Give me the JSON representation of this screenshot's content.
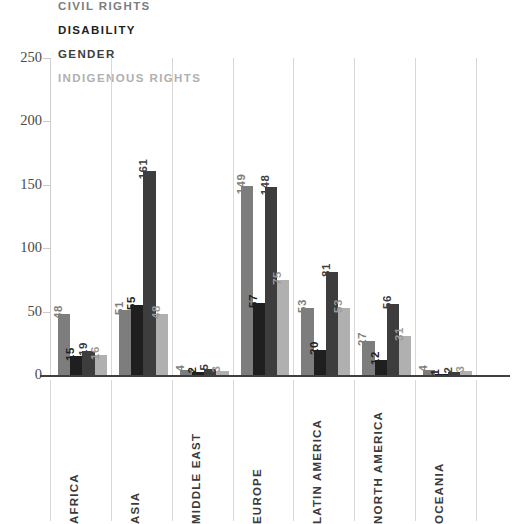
{
  "chart_data": {
    "type": "bar",
    "title": "",
    "xlabel": "",
    "ylabel": "",
    "ylim": [
      0,
      250
    ],
    "yticks": [
      0,
      50,
      100,
      150,
      200,
      250
    ],
    "grid": false,
    "legend_position": "top-left",
    "categories": [
      "AFRICA",
      "ASIA",
      "MIDDLE EAST",
      "EUROPE",
      "LATIN AMERICA",
      "NORTH AMERICA",
      "OCEANIA"
    ],
    "series": [
      {
        "name": "CIVIL RIGHTS",
        "color": "#7d7d7d",
        "values": [
          48,
          51,
          4,
          149,
          53,
          27,
          4
        ]
      },
      {
        "name": "DISABILITY",
        "color": "#1f1f1f",
        "values": [
          15,
          55,
          2,
          57,
          20,
          12,
          1
        ]
      },
      {
        "name": "GENDER",
        "color": "#3d3d3d",
        "values": [
          19,
          161,
          5,
          148,
          81,
          56,
          2
        ]
      },
      {
        "name": "INDIGENOUS RIGHTS",
        "color": "#b0b0b0",
        "values": [
          16,
          48,
          3,
          75,
          53,
          31,
          3
        ]
      }
    ]
  },
  "axis": {
    "tick_labels": [
      "250",
      "200",
      "150",
      "100",
      "50",
      "0"
    ],
    "tick_color": "#4a4a4a"
  },
  "colors": {
    "background": "#ffffff",
    "baseline": "#3f3f3f",
    "separator": "#d8d8d8",
    "spine": "#cfcfcf"
  }
}
